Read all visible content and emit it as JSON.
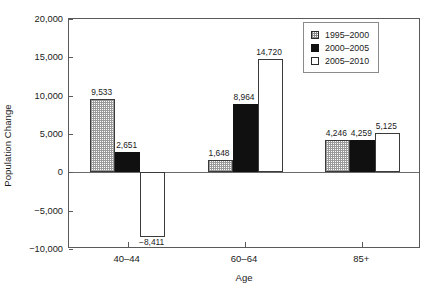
{
  "chart_data": {
    "type": "bar",
    "title": "",
    "xlabel": "Age",
    "ylabel": "Population Change",
    "categories": [
      "40–44",
      "60–64",
      "85+"
    ],
    "series": [
      {
        "name": "1995–2000",
        "values": [
          9533,
          1648,
          4246
        ],
        "fill": "dither-gray"
      },
      {
        "name": "2000–2005",
        "values": [
          2651,
          8964,
          4259
        ],
        "fill": "solid-black"
      },
      {
        "name": "2005–2010",
        "values": [
          -8411,
          14720,
          5125
        ],
        "fill": "white"
      }
    ],
    "value_labels": [
      [
        "9,533",
        "1,648",
        "4,246"
      ],
      [
        "2,651",
        "8,964",
        "4,259"
      ],
      [
        "−8,411",
        "14,720",
        "5,125"
      ]
    ],
    "ylim": [
      -10000,
      20000
    ],
    "yticks": [
      20000,
      15000,
      10000,
      5000,
      0,
      -5000,
      -10000
    ],
    "ytick_labels": [
      "20,000",
      "15,000",
      "10,000",
      "5,000",
      "0",
      "−5,000",
      "−10,000"
    ],
    "grid": false,
    "legend_position": "top-right",
    "zero_line": true
  },
  "legend": {
    "entries": [
      {
        "label": "1995–2000"
      },
      {
        "label": "2000–2005"
      },
      {
        "label": "2005–2010"
      }
    ]
  },
  "colors": {
    "axis": "#5a5a5a",
    "text": "#1a1a1a",
    "series_black": "#101010",
    "series_hatch": "#9a9a9a",
    "background": "#ffffff"
  }
}
